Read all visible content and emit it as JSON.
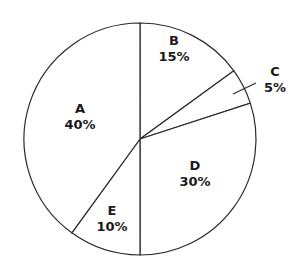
{
  "chart_data": {
    "type": "pie",
    "title": "",
    "start_angle_deg": 0,
    "direction": "clockwise",
    "slices": [
      {
        "label": "B",
        "value": 15,
        "display": "15%",
        "label_pos": [
          174,
          45
        ],
        "outside": false
      },
      {
        "label": "C",
        "value": 5,
        "display": "5%",
        "label_pos": [
          275,
          76
        ],
        "outside": true,
        "leader": [
          [
            233,
            94
          ],
          [
            256,
            83
          ]
        ]
      },
      {
        "label": "D",
        "value": 30,
        "display": "30%",
        "label_pos": [
          195,
          170
        ],
        "outside": false
      },
      {
        "label": "E",
        "value": 10,
        "display": "10%",
        "label_pos": [
          112,
          215
        ],
        "outside": false
      },
      {
        "label": "A",
        "value": 40,
        "display": "40%",
        "label_pos": [
          80,
          113
        ],
        "outside": false
      }
    ],
    "center": [
      140,
      139
    ],
    "radius": 116,
    "colors": {
      "fill": "#ffffff",
      "stroke": "#2a2a2a",
      "text": "#1a1a1a"
    }
  }
}
